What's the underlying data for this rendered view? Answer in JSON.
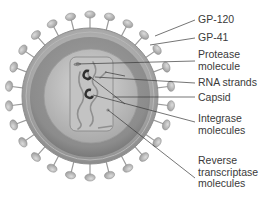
{
  "diagram": {
    "colors": {
      "background": "#ffffff",
      "spike_fill": "#b9b9b9",
      "membrane_outer": "#a6a6a6",
      "matrix_fill": "#8f8f8f",
      "inner_fill": "#c4c4c4",
      "capsid_fill": "#bdbdbd",
      "leader_line": "#3a3a3a",
      "label_text": "#3a3a3a"
    },
    "labels": [
      {
        "id": "gp120",
        "text": "GP-120"
      },
      {
        "id": "gp41",
        "text": "GP-41"
      },
      {
        "id": "protease",
        "text": "Protease\nmolecule"
      },
      {
        "id": "rna",
        "text": "RNA strands"
      },
      {
        "id": "capsid",
        "text": "Capsid"
      },
      {
        "id": "integrase",
        "text": "Integrase\nmolecules"
      },
      {
        "id": "rt",
        "text": "Reverse\ntranscriptase\nmolecules"
      }
    ]
  }
}
